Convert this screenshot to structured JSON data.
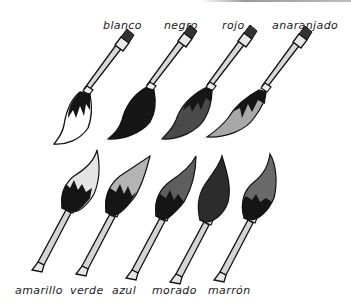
{
  "figure": {
    "top_row": [
      {
        "label": "blanco",
        "fill": "#ffffff"
      },
      {
        "label": "negro",
        "fill": "#161616"
      },
      {
        "label": "rojo",
        "fill": "#4a4a4a"
      },
      {
        "label": "anaranjado",
        "fill": "#a8a8a8"
      }
    ],
    "bottom_row": [
      {
        "label": "amarillo",
        "fill": "#e4e4e4"
      },
      {
        "label": "verde",
        "fill": "#b4b4b4"
      },
      {
        "label": "azul",
        "fill": "#5e5e5e"
      },
      {
        "label": "morado",
        "fill": "#2c2c2c"
      },
      {
        "label": "marrón",
        "fill": "#6a6a6a"
      }
    ]
  }
}
